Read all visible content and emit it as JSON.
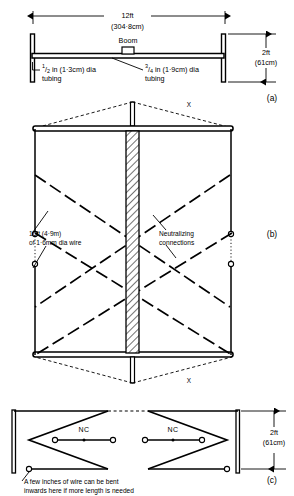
{
  "figure": {
    "panels": [
      {
        "id": "a",
        "label": "(a)",
        "desc": "Top view of boom and spreader assembly"
      },
      {
        "id": "b",
        "label": "(b)",
        "desc": "Front view of quad loop element with neutralizing connections"
      },
      {
        "id": "c",
        "label": "(c)",
        "desc": "Detail view of wire folding and NC points"
      }
    ]
  },
  "panel_a": {
    "panel_label": "(a)",
    "span_dim_ft": "12ft",
    "span_dim_cm": "(304·8cm)",
    "boom_label": "Boom",
    "small_tubing_num": "1",
    "small_tubing_den": "2",
    "small_tubing_text": " in (1·3cm) dia",
    "small_tubing_text2": "tubing",
    "large_tubing_num": "3",
    "large_tubing_den": "4",
    "large_tubing_text": " in (1·9cm) dia",
    "large_tubing_text2": "tubing",
    "height_dim_ft": "2ft",
    "height_dim_cm": "(61cm)"
  },
  "panel_b": {
    "panel_label": "(b)",
    "x_label_top": "X",
    "x_label_bottom": "X",
    "wire_label_line1": "16ft (4·9m)",
    "wire_label_line2": "of 1·6mm dia wire",
    "neutralizing_line1": "Neutralizing",
    "neutralizing_line2": "connections"
  },
  "panel_c": {
    "panel_label": "(c)",
    "nc_left": "NC",
    "nc_right": "NC",
    "height_dim_ft": "2ft",
    "height_dim_cm": "(61cm)",
    "note_line1": "A few inches of wire can be bent",
    "note_line2": "inwards here if more length is needed"
  },
  "colors": {
    "ink": "#000000",
    "paper": "#ffffff"
  }
}
